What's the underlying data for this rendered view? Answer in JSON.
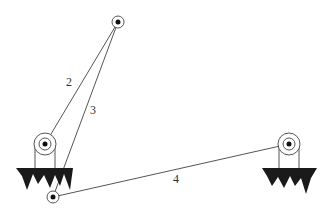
{
  "diagram": {
    "labels": [
      {
        "id": "member-2",
        "text": "2",
        "x": 70,
        "y": 86
      },
      {
        "id": "member-3",
        "text": "3",
        "x": 91,
        "y": 114
      },
      {
        "id": "member-4",
        "text": "4",
        "x": 173,
        "y": 183
      }
    ],
    "nodes": {
      "top_pin": {
        "x": 118,
        "y": 22
      },
      "left_pulley": {
        "x": 45,
        "y": 144
      },
      "right_pulley": {
        "x": 289,
        "y": 144
      },
      "bottom_pin": {
        "x": 53,
        "y": 197
      }
    },
    "colors": {
      "line": "#555555",
      "fill": "#1a1a1a"
    }
  }
}
